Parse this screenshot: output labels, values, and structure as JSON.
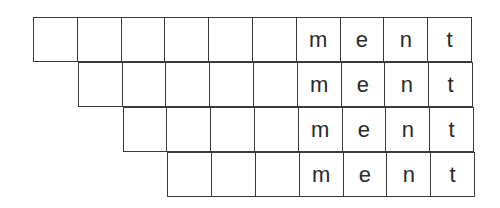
{
  "diagram": {
    "columns": 10,
    "rows": [
      {
        "offset": 0,
        "cells": [
          "",
          "",
          "",
          "",
          "",
          "",
          "m",
          "e",
          "n",
          "t"
        ]
      },
      {
        "offset": 1,
        "cells": [
          "",
          "",
          "",
          "",
          "",
          "m",
          "e",
          "n",
          "t"
        ]
      },
      {
        "offset": 2,
        "cells": [
          "",
          "",
          "",
          "",
          "m",
          "e",
          "n",
          "t"
        ]
      },
      {
        "offset": 3,
        "cells": [
          "",
          "",
          "",
          "m",
          "e",
          "n",
          "t"
        ]
      }
    ],
    "suffix": "ment"
  }
}
